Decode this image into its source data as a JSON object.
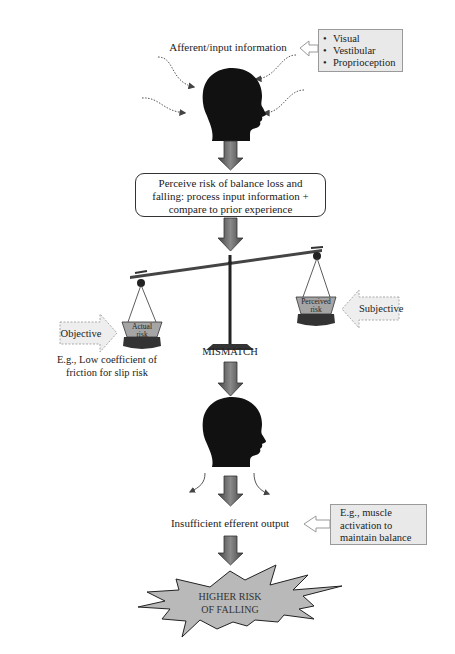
{
  "diagram": {
    "input_label": "Afferent/input information",
    "sensory_inputs": [
      "Visual",
      "Vestibular",
      "Proprioception"
    ],
    "process_box": {
      "lines": [
        "Perceive risk of balance loss and",
        "falling: process input information +",
        "compare to prior experience"
      ]
    },
    "scale": {
      "left_weight": {
        "line1": "Actual",
        "line2": "risk"
      },
      "right_weight": {
        "line1": "Perceived",
        "line2": "risk"
      },
      "left_arrow_label": "Objective",
      "right_arrow_label": "Subjective",
      "left_example": {
        "line1": "E.g., Low coefficient of",
        "line2": "friction for slip risk"
      },
      "center_label": "MISMATCH"
    },
    "output_label": "Insufficient efferent output",
    "output_example": {
      "line1": "E.g., muscle",
      "line2": "activation to",
      "line3": "maintain balance"
    },
    "outcome": {
      "line1": "HIGHER RISK",
      "line2": "OF FALLING"
    },
    "colors": {
      "head": "#111111",
      "arrow_dark": "#555555",
      "arrow_light": "#8a8a8a",
      "box_fill": "#e9e9e9",
      "starburst_fill": "#b9b9b9",
      "weight_fill": "#a5a5a5",
      "weight_base": "#333333"
    }
  }
}
